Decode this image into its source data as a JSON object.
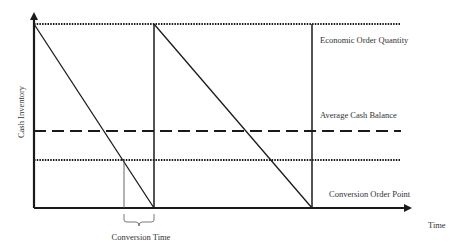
{
  "diagram": {
    "axes": {
      "y_label": "Cash Inventory",
      "x_label": "Time"
    },
    "levels": {
      "economic_order_quantity": "Economic Order Quantity",
      "average_cash_balance": "Average Cash Balance",
      "conversion_order_point": "Conversion Order Point"
    },
    "annotations": {
      "conversion_time": "Conversion Time"
    },
    "colors": {
      "line": "#1a1a1a",
      "text": "#333333",
      "background": "#ffffff"
    }
  }
}
